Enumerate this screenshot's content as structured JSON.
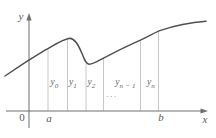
{
  "figure": {
    "colors": {
      "axis": "#6f6f6f",
      "curve": "#4e4e4e",
      "ordinate_line": "#c8c8c8",
      "label": "#5a5a5a"
    },
    "axis_labels": {
      "y": "y",
      "x": "x",
      "origin": "0",
      "a": "a",
      "b": "b"
    },
    "ordinate_labels": [
      {
        "base": "y",
        "sub": "0"
      },
      {
        "base": "y",
        "sub": "1"
      },
      {
        "base": "y",
        "sub": "2"
      },
      {
        "base": "y",
        "sub": "n − 1"
      },
      {
        "base": "y",
        "sub": "n"
      }
    ],
    "ellipsis": "..."
  }
}
